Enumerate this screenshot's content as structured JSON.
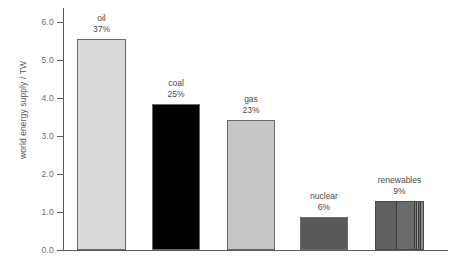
{
  "chart_data": {
    "type": "bar",
    "title": "",
    "xlabel": "",
    "ylabel": "world energy supply / TW",
    "ylim": [
      0.0,
      6.0
    ],
    "yticks": [
      "0.0",
      "1.0",
      "2.0",
      "3.0",
      "4.0",
      "5.0",
      "6.0"
    ],
    "grid": false,
    "legend": "none",
    "categories": [
      "oil",
      "coal",
      "gas",
      "nuclear",
      "renewables"
    ],
    "values": [
      5.55,
      3.83,
      3.43,
      0.88,
      1.3
    ],
    "percent_labels": [
      "37%",
      "25%",
      "23%",
      "6%",
      "9%"
    ],
    "bars": [
      {
        "name": "oil",
        "percent": "37%",
        "value": 5.55,
        "color": "#d9d9d9",
        "segments": []
      },
      {
        "name": "coal",
        "percent": "25%",
        "value": 3.83,
        "color": "#000000",
        "segments": []
      },
      {
        "name": "gas",
        "percent": "23%",
        "value": 3.43,
        "color": "#c6c6c6",
        "segments": []
      },
      {
        "name": "nuclear",
        "percent": "6%",
        "value": 0.88,
        "color": "#595959",
        "segments": []
      },
      {
        "name": "renewables",
        "percent": "9%",
        "value": 1.3,
        "color": "#5e5e5e",
        "segments": [
          {
            "width_pct": 44,
            "color": "#606060"
          },
          {
            "width_pct": 38,
            "color": "#6b6b6b"
          },
          {
            "width_pct": 6,
            "color": "#7a7a7a"
          },
          {
            "width_pct": 4,
            "color": "#9a9a9a"
          },
          {
            "width_pct": 4,
            "color": "#6f6f6f"
          },
          {
            "width_pct": 4,
            "color": "#8a8a8a"
          }
        ]
      }
    ]
  },
  "axis": {
    "y_title": "world energy supply / TW",
    "ticks": [
      {
        "label": "6.0",
        "value": 6.0
      },
      {
        "label": "5.0",
        "value": 5.0
      },
      {
        "label": "4.0",
        "value": 4.0
      },
      {
        "label": "3.0",
        "value": 3.0
      },
      {
        "label": "2.0",
        "value": 2.0
      },
      {
        "label": "1.0",
        "value": 1.0
      },
      {
        "label": "0.0",
        "value": 0.0
      }
    ]
  }
}
